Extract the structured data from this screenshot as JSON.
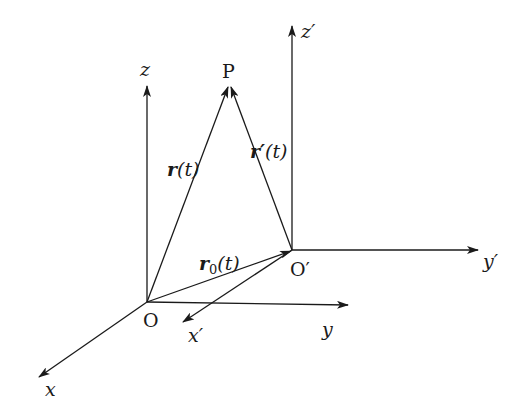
{
  "diagram": {
    "type": "reference-frames-vector-diagram",
    "stroke_color": "#1a1a1a",
    "background": "#ffffff",
    "points": {
      "O": {
        "label": "O",
        "x": 147,
        "y": 302
      },
      "O_prime": {
        "label": "O′",
        "x": 292,
        "y": 250
      },
      "P": {
        "label": "P",
        "x": 229,
        "y": 85
      }
    },
    "axes": {
      "x": {
        "label": "x",
        "from": [
          147,
          302
        ],
        "to": [
          38,
          378
        ]
      },
      "y": {
        "label": "y",
        "from": [
          147,
          302
        ],
        "to": [
          348,
          305
        ]
      },
      "z": {
        "label": "z",
        "from": [
          147,
          302
        ],
        "to": [
          147,
          85
        ]
      },
      "x_prime": {
        "label": "x′",
        "from": [
          292,
          250
        ],
        "to": [
          182,
          323
        ]
      },
      "y_prime": {
        "label": "y′",
        "from": [
          292,
          250
        ],
        "to": [
          478,
          250
        ]
      },
      "z_prime": {
        "label": "z′",
        "from": [
          292,
          250
        ],
        "to": [
          292,
          25
        ]
      }
    },
    "vectors": {
      "r": {
        "label_main": "r",
        "label_arg": "(t)",
        "from": "O",
        "to": "P"
      },
      "r_prime": {
        "label_main": "r′",
        "label_arg": "(t)",
        "from": "O_prime",
        "to": "P"
      },
      "r0": {
        "label_main": "r",
        "label_sub": "0",
        "label_arg": "(t)",
        "from": "O",
        "to": "O_prime"
      }
    }
  }
}
